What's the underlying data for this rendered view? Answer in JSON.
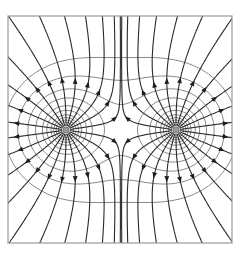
{
  "diagram": {
    "type": "electric-field-lines",
    "frame": {
      "x": 8,
      "y": 16,
      "width": 224,
      "height": 227,
      "stroke": "#9a9a9a"
    },
    "charges": [
      {
        "id": "left-charge",
        "x": 66,
        "y": 130,
        "r": 3.2,
        "fill": "#9a9a9a"
      },
      {
        "id": "right-charge",
        "x": 176,
        "y": 130,
        "r": 3.2,
        "fill": "#9a9a9a"
      }
    ],
    "colors": {
      "field_line": "#2a2a2a",
      "equipotential": "#8a8a8a",
      "arrow": "#1e1e1e"
    },
    "field_lines_per_charge": 22,
    "arrow_direction": "outward"
  }
}
